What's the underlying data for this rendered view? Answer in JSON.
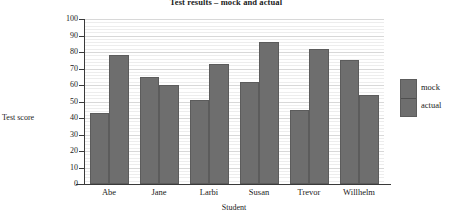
{
  "chart_data": {
    "type": "bar",
    "title": "Test results – mock and actual",
    "xlabel": "Student",
    "ylabel": "Test score",
    "categories": [
      "Abe",
      "Jane",
      "Larbi",
      "Susan",
      "Trevor",
      "Willhelm"
    ],
    "series": [
      {
        "name": "mock",
        "values": [
          43,
          65,
          51,
          62,
          45,
          75
        ]
      },
      {
        "name": "actual",
        "values": [
          78,
          60,
          73,
          86,
          82,
          54
        ]
      }
    ],
    "ylim": [
      0,
      100
    ],
    "yticks": [
      0,
      10,
      20,
      30,
      40,
      50,
      60,
      70,
      80,
      90,
      100
    ],
    "ytick_labels": [
      "0",
      "10",
      "20",
      "30",
      "40",
      "50",
      "60",
      "70",
      "80",
      "90",
      "100"
    ],
    "grid": true,
    "grid_minor_step": 2,
    "legend_position": "right",
    "bar_color": "#6e6e6e",
    "bar_edge_color": "#5c5c5c",
    "background": "#ffffff"
  }
}
